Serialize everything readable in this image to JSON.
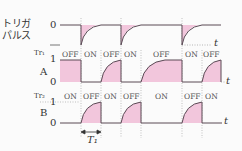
{
  "trigger": {
    "label_line1": "トリガ",
    "label_line2": "パルス",
    "level_zero": "0",
    "axis_label": "t"
  },
  "tr1": {
    "name": "Tr₁",
    "output": "A",
    "level_one": "1",
    "level_zero": "0",
    "axis_label": "t",
    "states": [
      "OFF",
      "ON",
      "OFF",
      "ON",
      "OFF",
      "ON",
      "OFF"
    ]
  },
  "tr2": {
    "name": "Tr₂",
    "output": "B",
    "level_one": "1",
    "level_zero": "0",
    "axis_label": "t",
    "states": [
      "ON",
      "OFF",
      "ON",
      "OFF",
      "ON",
      "OFF",
      "ON"
    ]
  },
  "period_label": "T₁",
  "colors": {
    "waveform": "#5a4a55",
    "fill": "#f2c6dc",
    "dotted": "#8a8a8a",
    "text": "#333333"
  }
}
